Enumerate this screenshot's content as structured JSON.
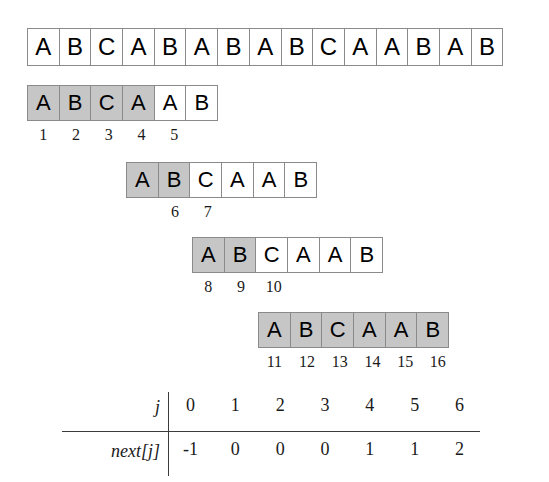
{
  "figure": {
    "colors": {
      "shaded_cell": "#c6c6c6",
      "cell_border": "#8a8a8a",
      "text": "#000000",
      "rule": "#3b3b3b",
      "background": "#ffffff"
    },
    "text_row": {
      "name": "text",
      "chars": [
        "A",
        "B",
        "C",
        "A",
        "B",
        "A",
        "B",
        "A",
        "B",
        "C",
        "A",
        "A",
        "B",
        "A",
        "B"
      ]
    },
    "attempts": [
      {
        "label": "attempt-1",
        "chars": [
          "A",
          "B",
          "C",
          "A",
          "A",
          "B"
        ],
        "shaded": [
          true,
          true,
          true,
          true,
          false,
          false
        ],
        "comparisons": [
          {
            "index": "1",
            "cell": 0
          },
          {
            "index": "2",
            "cell": 1
          },
          {
            "index": "3",
            "cell": 2
          },
          {
            "index": "4",
            "cell": 3
          },
          {
            "index": "5",
            "cell": 4
          }
        ]
      },
      {
        "label": "attempt-2",
        "chars": [
          "A",
          "B",
          "C",
          "A",
          "A",
          "B"
        ],
        "shaded": [
          true,
          true,
          false,
          false,
          false,
          false
        ],
        "comparisons": [
          {
            "index": "6",
            "cell": 1
          },
          {
            "index": "7",
            "cell": 2
          }
        ]
      },
      {
        "label": "attempt-3",
        "chars": [
          "A",
          "B",
          "C",
          "A",
          "A",
          "B"
        ],
        "shaded": [
          true,
          true,
          false,
          false,
          false,
          false
        ],
        "comparisons": [
          {
            "index": "8",
            "cell": 0
          },
          {
            "index": "9",
            "cell": 1
          },
          {
            "index": "10",
            "cell": 2
          }
        ]
      },
      {
        "label": "attempt-4",
        "chars": [
          "A",
          "B",
          "C",
          "A",
          "A",
          "B"
        ],
        "shaded": [
          true,
          true,
          true,
          true,
          true,
          true
        ],
        "comparisons": [
          {
            "index": "11",
            "cell": 0
          },
          {
            "index": "12",
            "cell": 1
          },
          {
            "index": "13",
            "cell": 2
          },
          {
            "index": "14",
            "cell": 3
          },
          {
            "index": "15",
            "cell": 4
          },
          {
            "index": "16",
            "cell": 5
          }
        ]
      }
    ],
    "next_table": {
      "row_labels": [
        "j",
        "next[j]"
      ],
      "j_values": [
        "0",
        "1",
        "2",
        "3",
        "4",
        "5",
        "6"
      ],
      "next_values": [
        "-1",
        "0",
        "0",
        "0",
        "1",
        "1",
        "2"
      ]
    }
  }
}
